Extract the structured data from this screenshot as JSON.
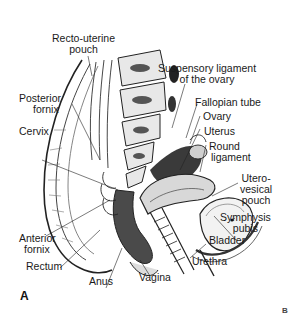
{
  "figure": {
    "panel_labels": {
      "a": "A",
      "b": "B"
    },
    "labels": {
      "recto_uterine_pouch": {
        "line1": "Recto-uterine",
        "line2": "pouch"
      },
      "suspensory_ligament": {
        "line1": "Suspensory ligament",
        "line2": "of the ovary"
      },
      "posterior_fornix": {
        "line1": "Posterior",
        "line2": "fornix"
      },
      "fallopian_tube": "Fallopian tube",
      "ovary": "Ovary",
      "cervix": "Cervix",
      "uterus": "Uterus",
      "round_ligament": {
        "line1": "Round",
        "line2": "ligament"
      },
      "utero_vesical_pouch": {
        "line1": "Utero-",
        "line2": "vesical",
        "line3": "pouch"
      },
      "symphysis_pubis": {
        "line1": "Symphysis",
        "line2": "pubis"
      },
      "bladder": "Bladder",
      "anterior_fornix": {
        "line1": "Anterior",
        "line2": "fornix"
      },
      "rectum": "Rectum",
      "urethra": "Urethra",
      "anus": "Anus",
      "vagina": "Vagina"
    },
    "colors": {
      "ink": "#1a1a1a",
      "shade": "#555555",
      "background": "#ffffff"
    }
  }
}
